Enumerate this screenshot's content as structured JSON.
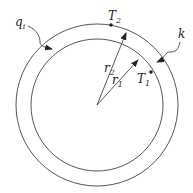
{
  "diagram": {
    "type": "cylindrical-shell-cross-section",
    "labels": {
      "heat_flux": "q",
      "heat_flux_sub": "i",
      "conductivity": "k",
      "outer_temp": "T",
      "outer_temp_sub": "2",
      "inner_temp": "T",
      "inner_temp_sub": "1",
      "outer_radius": "r",
      "outer_radius_sub": "2",
      "inner_radius": "r",
      "inner_radius_sub": "1"
    },
    "colors": {
      "stroke": "#555555",
      "text": "#222222",
      "background": "#ffffff"
    }
  }
}
